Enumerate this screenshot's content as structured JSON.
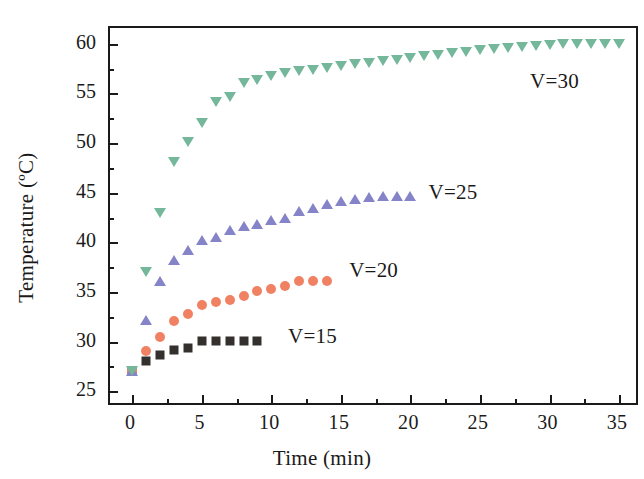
{
  "chart_data": {
    "type": "scatter",
    "title": "",
    "xlabel": "Time (min)",
    "ylabel": "Temperature (ºC)",
    "xlim": [
      -1.6,
      36.5
    ],
    "ylim": [
      23.4,
      61.6
    ],
    "xticks": [
      0,
      5,
      10,
      15,
      20,
      25,
      30,
      35
    ],
    "yticks": [
      25,
      30,
      35,
      40,
      45,
      50,
      55,
      60
    ],
    "xtick_labels": [
      "0",
      "5",
      "10",
      "15",
      "20",
      "25",
      "30",
      "35"
    ],
    "ytick_labels": [
      "25",
      "30",
      "35",
      "40",
      "45",
      "50",
      "55",
      "60"
    ],
    "x_minor_ticks": [
      2.5,
      7.5,
      12.5,
      17.5,
      22.5,
      27.5,
      32.5
    ],
    "y_minor_ticks": [
      27.5,
      32.5,
      37.5,
      42.5,
      47.5,
      52.5,
      57.5
    ],
    "grid": false,
    "legend": "inline-annotations",
    "series": [
      {
        "name": "V=15",
        "label": "V=15",
        "color": "#33302e",
        "marker": "square",
        "annotation": {
          "x": 11.2,
          "y": 30.5
        },
        "x": [
          0,
          1,
          2,
          3,
          4,
          5,
          6,
          7,
          8,
          9
        ],
        "y": [
          27.0,
          28.0,
          28.6,
          29.1,
          29.3,
          30.1,
          30.1,
          30.1,
          30.1,
          30.1
        ]
      },
      {
        "name": "V=20",
        "label": "V=20",
        "color": "#f08263",
        "marker": "circle",
        "annotation": {
          "x": 15.6,
          "y": 37.1
        },
        "x": [
          0,
          1,
          2,
          3,
          4,
          5,
          6,
          7,
          8,
          9,
          10,
          11,
          12,
          13,
          14
        ],
        "y": [
          27.0,
          29.0,
          30.5,
          32.1,
          32.8,
          33.7,
          34.0,
          34.2,
          34.6,
          35.1,
          35.3,
          35.6,
          36.1,
          36.1,
          36.1
        ]
      },
      {
        "name": "V=25",
        "label": "V=25",
        "color": "#8684c8",
        "marker": "triangle-up",
        "annotation": {
          "x": 21.3,
          "y": 45.0
        },
        "x": [
          0,
          1,
          2,
          3,
          4,
          5,
          6,
          7,
          8,
          9,
          10,
          11,
          12,
          13,
          14,
          15,
          16,
          17,
          18,
          19,
          20
        ],
        "y": [
          27.0,
          32.2,
          36.1,
          38.2,
          39.2,
          40.2,
          40.5,
          41.2,
          41.6,
          41.8,
          42.2,
          42.5,
          43.2,
          43.5,
          43.9,
          44.2,
          44.4,
          44.6,
          44.7,
          44.7,
          44.7
        ]
      },
      {
        "name": "V=30",
        "label": "V=30",
        "color": "#74b79a",
        "marker": "triangle-down",
        "annotation": {
          "x": 28.6,
          "y": 56.2
        },
        "x": [
          0,
          1,
          2,
          3,
          4,
          5,
          6,
          7,
          8,
          9,
          10,
          11,
          12,
          13,
          14,
          15,
          16,
          17,
          18,
          19,
          20,
          21,
          22,
          23,
          24,
          25,
          26,
          27,
          28,
          29,
          30,
          31,
          32,
          33,
          34,
          35
        ],
        "y": [
          27.0,
          37.0,
          43.0,
          48.1,
          50.1,
          52.0,
          54.1,
          54.6,
          56.1,
          56.4,
          56.8,
          57.1,
          57.3,
          57.4,
          57.6,
          57.8,
          58.0,
          58.1,
          58.3,
          58.4,
          58.6,
          58.8,
          58.9,
          59.1,
          59.2,
          59.4,
          59.5,
          59.6,
          59.7,
          59.8,
          59.9,
          60.0,
          60.0,
          60.0,
          60.0,
          60.0
        ]
      }
    ]
  }
}
